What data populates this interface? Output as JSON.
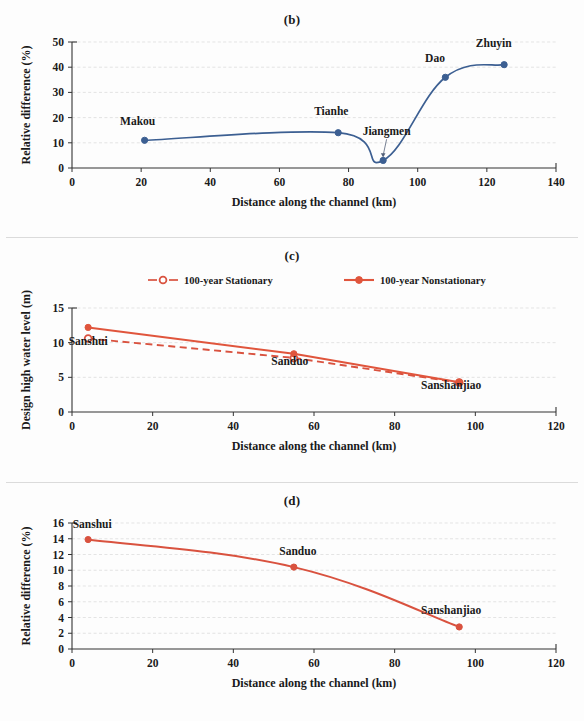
{
  "figure": {
    "panels": [
      {
        "id": "b",
        "title": "(b)"
      },
      {
        "id": "c",
        "title": "(c)"
      },
      {
        "id": "d",
        "title": "(d)"
      }
    ]
  },
  "colors": {
    "series_blue": "#3c5f92",
    "series_red": "#e0553c",
    "series_red_dashed": "#d9523f",
    "axis": "#333333",
    "grid": "#d9d9d9",
    "text": "#1a1a1a"
  },
  "chart_data": [
    {
      "id": "b",
      "type": "line",
      "title": "(b)",
      "xlabel": "Distance along the channel (km)",
      "ylabel": "Relative difference (%)",
      "xlim": [
        0,
        140
      ],
      "ylim": [
        0,
        50
      ],
      "xticks": [
        0,
        20,
        40,
        60,
        80,
        100,
        120,
        140
      ],
      "yticks": [
        0,
        10,
        20,
        30,
        40,
        50
      ],
      "grid": true,
      "legend": null,
      "series": [
        {
          "name": "Relative difference",
          "color": "#3c5f92",
          "style": "solid",
          "marker": "filled-circle",
          "x": [
            21,
            77,
            90,
            108,
            125
          ],
          "y": [
            11,
            14,
            3,
            36,
            41
          ],
          "point_labels": [
            "Makou",
            "Tianhe",
            "Jiangmen",
            "Dao",
            "Zhuyin"
          ]
        }
      ],
      "annotations": [
        {
          "text": "Makou",
          "x": 21,
          "y": 11,
          "dx": -2,
          "dy": 6,
          "leader": false
        },
        {
          "text": "Tianhe",
          "x": 77,
          "y": 14,
          "dx": -2,
          "dy": 7,
          "leader": false
        },
        {
          "text": "Jiangmen",
          "x": 90,
          "y": 3,
          "dx": 1,
          "dy": 10,
          "leader": true
        },
        {
          "text": "Dao",
          "x": 108,
          "y": 36,
          "dx": -3,
          "dy": 6,
          "leader": false
        },
        {
          "text": "Zhuyin",
          "x": 125,
          "y": 41,
          "dx": -3,
          "dy": 7,
          "leader": false
        }
      ]
    },
    {
      "id": "c",
      "type": "line",
      "title": "(c)",
      "xlabel": "Distance along the channel (km)",
      "ylabel": "Design high water level (m)",
      "xlim": [
        0,
        120
      ],
      "ylim": [
        0,
        15
      ],
      "xticks": [
        0,
        20,
        40,
        60,
        80,
        100,
        120
      ],
      "yticks": [
        0,
        5,
        10,
        15
      ],
      "grid": true,
      "legend": {
        "position": "top-center",
        "entries": [
          "100-year Stationary",
          "100-year Nonstationary"
        ]
      },
      "series": [
        {
          "name": "100-year Stationary",
          "color": "#d9523f",
          "style": "dashed",
          "marker": "hollow-circle",
          "x": [
            4,
            55,
            96
          ],
          "y": [
            10.6,
            7.8,
            4.25
          ]
        },
        {
          "name": "100-year Nonstationary",
          "color": "#e0553c",
          "style": "solid",
          "marker": "filled-circle",
          "x": [
            4,
            55,
            96
          ],
          "y": [
            12.2,
            8.4,
            4.3
          ]
        }
      ],
      "annotations": [
        {
          "text": "Sanshui",
          "x": 4,
          "y": 10.6,
          "dx": 0,
          "dy": -0.9,
          "leader": false
        },
        {
          "text": "Sanduo",
          "x": 55,
          "y": 7.8,
          "dx": -1,
          "dy": -1.0,
          "leader": false
        },
        {
          "text": "Sanshanjiao",
          "x": 96,
          "y": 4.25,
          "dx": -2,
          "dy": -0.9,
          "leader": false
        }
      ]
    },
    {
      "id": "d",
      "type": "line",
      "title": "(d)",
      "xlabel": "Distance along the channel (km)",
      "ylabel": "Relative difference (%)",
      "xlim": [
        0,
        120
      ],
      "ylim": [
        0,
        16
      ],
      "xticks": [
        0,
        20,
        40,
        60,
        80,
        100,
        120
      ],
      "yticks": [
        0,
        2,
        4,
        6,
        8,
        10,
        12,
        14,
        16
      ],
      "grid": true,
      "legend": null,
      "series": [
        {
          "name": "Relative difference",
          "color": "#d9523f",
          "style": "solid",
          "marker": "filled-circle",
          "x": [
            4,
            55,
            96
          ],
          "y": [
            13.9,
            10.4,
            2.8
          ],
          "point_labels": [
            "Sanshui",
            "Sanduo",
            "Sanshanjiao"
          ]
        }
      ],
      "annotations": [
        {
          "text": "Sanshui",
          "x": 4,
          "y": 13.9,
          "dx": 1,
          "dy": 1.5,
          "leader": false
        },
        {
          "text": "Sanduo",
          "x": 55,
          "y": 10.4,
          "dx": 1,
          "dy": 1.6,
          "leader": false
        },
        {
          "text": "Sanshanjiao",
          "x": 96,
          "y": 2.8,
          "dx": -2,
          "dy": 1.6,
          "leader": false
        }
      ]
    }
  ]
}
